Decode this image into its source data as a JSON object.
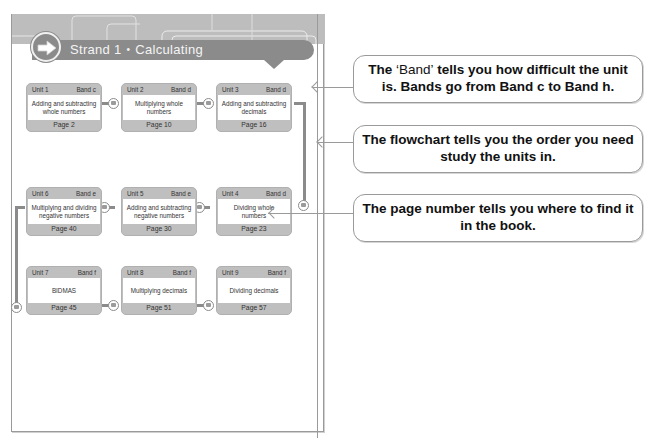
{
  "page": {
    "strand": {
      "label": "Strand 1",
      "separator": "•",
      "title": "Calculating",
      "icon": "arrow-right-icon"
    }
  },
  "units": [
    {
      "unit": "Unit 1",
      "band": "Band c",
      "title": "Adding and subtracting whole numbers",
      "page": "Page 2"
    },
    {
      "unit": "Unit 2",
      "band": "Band d",
      "title": "Multiplying whole numbers",
      "page": "Page 10"
    },
    {
      "unit": "Unit 3",
      "band": "Band d",
      "title": "Adding and subtracting decimals",
      "page": "Page 16"
    },
    {
      "unit": "Unit 4",
      "band": "Band d",
      "title": "Dividing whole numbers",
      "page": "Page 23"
    },
    {
      "unit": "Unit 5",
      "band": "Band e",
      "title": "Adding and subtracting negative numbers",
      "page": "Page 30"
    },
    {
      "unit": "Unit 6",
      "band": "Band e",
      "title": "Multiplying and dividing negative numbers",
      "page": "Page 40"
    },
    {
      "unit": "Unit 7",
      "band": "Band f",
      "title": "BIDMAS",
      "page": "Page 45"
    },
    {
      "unit": "Unit 8",
      "band": "Band f",
      "title": "Multiplying decimals",
      "page": "Page 51"
    },
    {
      "unit": "Unit 9",
      "band": "Band f",
      "title": "Dividing decimals",
      "page": "Page 57"
    }
  ],
  "callouts": [
    {
      "prefix": "The ",
      "quoted": "‘Band’",
      "rest": " tells you how difficult the unit is. Bands go from Band c to Band h."
    },
    {
      "text": "The flowchart tells you the order you need study the units in."
    },
    {
      "text": "The page number tells you where to find it in the book."
    }
  ],
  "colors": {
    "header_gray": "#8b8b8b",
    "header_bg": "#bdbdbd",
    "unit_frame": "#bfbfbf",
    "border": "#9a9a9a"
  }
}
